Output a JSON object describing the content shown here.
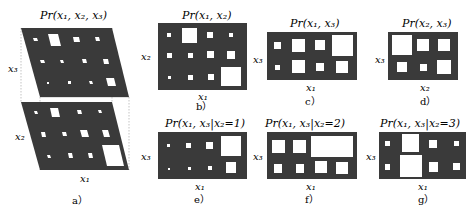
{
  "colors": {
    "background": "#ffffff",
    "panel": "#3a3a3a",
    "cell": "#ffffff",
    "guide": "#9a9a9a"
  },
  "panels": {
    "a": {
      "caption": "a）",
      "title": "Pr(x₁, x₂, x₃)",
      "xlabel": "x₁",
      "ylabel_top": "x₃",
      "ylabel_bottom": "x₂"
    },
    "b": {
      "caption": "b）",
      "title": "Pr(x₁, x₂)",
      "xlabel": "x₁",
      "ylabel": "x₂"
    },
    "c": {
      "caption": "c）",
      "title": "Pr(x₁, x₃)",
      "xlabel": "x₁",
      "ylabel": "x₃"
    },
    "d": {
      "caption": "d）",
      "title": "Pr(x₂, x₃)",
      "xlabel": "x₂",
      "ylabel": "x₃"
    },
    "e": {
      "caption": "e）",
      "title": "Pr(x₁, x₃|x₂=1)",
      "xlabel": "x₁",
      "ylabel": "x₃"
    },
    "f": {
      "caption": "f）",
      "title": "Pr(x₁, x₃|x₂=2)",
      "xlabel": "x₁",
      "ylabel": "x₃"
    },
    "g": {
      "caption": "g）",
      "title": "Pr(x₁, x₃|x₂=3)",
      "xlabel": "x₁",
      "ylabel": "x₃"
    }
  }
}
